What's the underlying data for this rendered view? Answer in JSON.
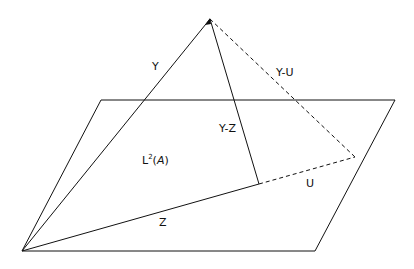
{
  "diagram": {
    "labels": {
      "y": "Y",
      "y_minus_u": "Y-U",
      "y_minus_z": "Y-Z",
      "space_prefix": "L",
      "space_sup": "2",
      "space_open": "(",
      "space_arg": "A",
      "space_close": ")",
      "u": "U",
      "z": "Z"
    },
    "colors": {
      "stroke": "#111111",
      "background": "#ffffff"
    }
  }
}
